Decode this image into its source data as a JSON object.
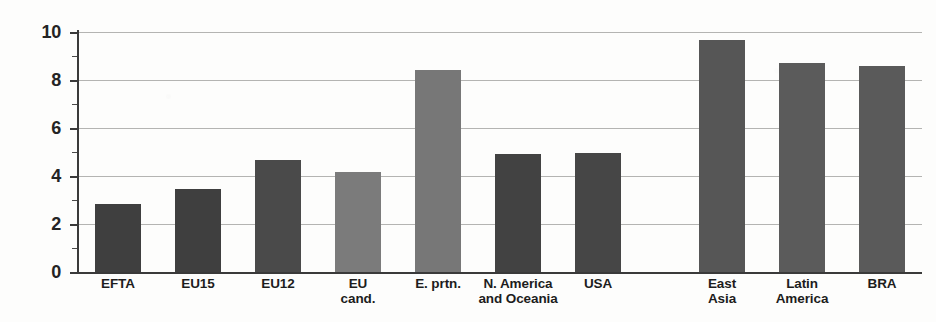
{
  "chart_data": {
    "type": "bar",
    "title": "",
    "subtitle": "",
    "xlabel": "",
    "ylabel": "",
    "ylim": [
      0,
      10
    ],
    "y_major_ticks": [
      0,
      2,
      4,
      6,
      8,
      10
    ],
    "y_minor_ticks": [
      1,
      3,
      5,
      7,
      9
    ],
    "y_tick_labels": [
      "0",
      "2",
      "4",
      "6",
      "8",
      "10"
    ],
    "grid": true,
    "gridlines_at": [
      0,
      2,
      4,
      6,
      8,
      10
    ],
    "legend": null,
    "legend_position": "none",
    "categories": [
      "EFTA",
      "EU15",
      "EU12",
      "EU cand.",
      "E. prtn.",
      "N. America and Oceania",
      "USA",
      "East Asia",
      "Latin America",
      "BRA"
    ],
    "category_label_lines": [
      [
        "EFTA"
      ],
      [
        "EU15"
      ],
      [
        "EU12"
      ],
      [
        "EU",
        "cand."
      ],
      [
        "E. prtn."
      ],
      [
        "N. America",
        "and Oceania"
      ],
      [
        "USA"
      ],
      [
        "East",
        "Asia"
      ],
      [
        "Latin",
        "America"
      ],
      [
        "BRA"
      ]
    ],
    "values": [
      2.85,
      3.45,
      4.65,
      4.15,
      8.4,
      4.9,
      4.95,
      9.65,
      8.7,
      8.6
    ],
    "bar_colors": [
      "#3f3f3f",
      "#3f3f3f",
      "#4a4a4a",
      "#7b7b7b",
      "#777777",
      "#424242",
      "#464646",
      "#565656",
      "#5b5b5b",
      "#5a5a5a"
    ],
    "bar_shades": {
      "dark": "#3f3f3f",
      "medium_dark": "#565656",
      "medium_light": "#7b7b7b"
    },
    "axis_color": "#3a3a3a",
    "gridline_color": "#b4b4b2",
    "background_color": "#fdfdfc",
    "group_break_after_index": 6
  }
}
